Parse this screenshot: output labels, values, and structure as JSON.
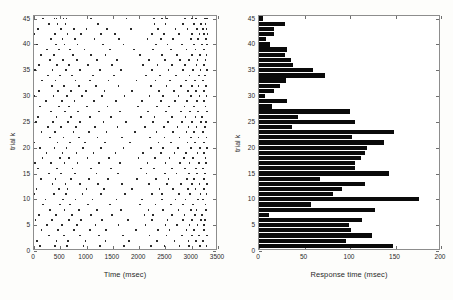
{
  "figure": {
    "panels": [
      {
        "id": "raster",
        "xlabel": "Time (msec)",
        "ylabel": "trial k",
        "xticks": [
          0,
          500,
          1000,
          1500,
          2000,
          2500,
          3000,
          3500
        ],
        "yticks": [
          0,
          5,
          10,
          15,
          20,
          25,
          30,
          35,
          40,
          45
        ]
      },
      {
        "id": "response",
        "xlabel": "Response time (msec)",
        "ylabel": "trial k",
        "xticks": [
          0,
          50,
          100,
          150,
          200
        ],
        "yticks": [
          0,
          5,
          10,
          15,
          20,
          25,
          30,
          35,
          40,
          45
        ]
      }
    ]
  },
  "chart_data": [
    {
      "type": "scatter",
      "title": "",
      "xlabel": "Time (msec)",
      "ylabel": "trial k",
      "xlim": [
        0,
        3500
      ],
      "ylim": [
        0,
        45.5
      ],
      "xticks": [
        0,
        500,
        1000,
        1500,
        2000,
        2500,
        3000,
        3500
      ],
      "yticks": [
        0,
        5,
        10,
        15,
        20,
        25,
        30,
        35,
        40,
        45
      ],
      "grid": false,
      "legend": null,
      "marker": "square",
      "marker_color": "#2b2b2b",
      "description": "Spike raster: each row k is a trial, each dot a spike time.",
      "trials": [
        {
          "k": 45,
          "spikes": [
            170,
            390,
            430,
            560,
            620,
            1090,
            1760,
            2280,
            2430,
            2530,
            2870,
            3010,
            3080,
            3250,
            3290
          ]
        },
        {
          "k": 44,
          "spikes": [
            290,
            450,
            600,
            1220,
            2290,
            2500,
            2840,
            3050,
            3180,
            3260
          ]
        },
        {
          "k": 43,
          "spikes": [
            80,
            520,
            760,
            1000,
            1390,
            1840,
            2360,
            2690,
            2920,
            3100,
            3220,
            3280
          ]
        },
        {
          "k": 42,
          "spikes": [
            10,
            400,
            640,
            900,
            1270,
            1540,
            2250,
            2470,
            2760,
            3000,
            3150,
            3230,
            3300
          ]
        },
        {
          "k": 41,
          "spikes": [
            330,
            540,
            780,
            1150,
            1620,
            2160,
            2410,
            2650,
            2980,
            3120,
            3270
          ]
        },
        {
          "k": 40,
          "spikes": [
            60,
            420,
            580,
            830,
            1310,
            1700,
            2320,
            2540,
            2810,
            3040,
            3190,
            3290
          ]
        },
        {
          "k": 39,
          "spikes": [
            250,
            470,
            680,
            960,
            1450,
            1900,
            2270,
            2600,
            2900,
            3070,
            3240
          ]
        },
        {
          "k": 38,
          "spikes": [
            130,
            380,
            740,
            1080,
            1360,
            2020,
            2440,
            2720,
            3010,
            3160,
            3280
          ]
        },
        {
          "k": 37,
          "spikes": [
            310,
            550,
            820,
            1200,
            1580,
            2190,
            2490,
            2780,
            2950,
            3110,
            3260
          ]
        },
        {
          "k": 36,
          "spikes": [
            90,
            440,
            660,
            1030,
            1480,
            2080,
            2350,
            2630,
            2870,
            3090,
            3230
          ]
        },
        {
          "k": 35,
          "spikes": [
            20,
            350,
            610,
            870,
            1250,
            1660,
            2240,
            2560,
            2840,
            3020,
            3170,
            3290
          ]
        },
        {
          "k": 34,
          "spikes": [
            270,
            500,
            720,
            1120,
            1520,
            2130,
            2400,
            2700,
            2960,
            3140,
            3250
          ]
        },
        {
          "k": 33,
          "spikes": [
            150,
            410,
            790,
            1060,
            1420,
            1950,
            2310,
            2590,
            2890,
            3060,
            3210
          ]
        },
        {
          "k": 32,
          "spikes": [
            340,
            570,
            850,
            1180,
            1610,
            2230,
            2520,
            2800,
            3000,
            3130,
            3270
          ]
        },
        {
          "k": 31,
          "spikes": [
            100,
            460,
            700,
            990,
            1340,
            1870,
            2380,
            2660,
            2930,
            3080,
            3240
          ]
        },
        {
          "k": 30,
          "spikes": [
            10,
            370,
            630,
            910,
            1290,
            1720,
            2200,
            2460,
            2750,
            2990,
            3150,
            3280
          ]
        },
        {
          "k": 29,
          "spikes": [
            230,
            530,
            770,
            1140,
            1560,
            2060,
            2420,
            2680,
            2910,
            3100,
            3230
          ]
        },
        {
          "k": 28,
          "spikes": [
            120,
            480,
            670,
            1010,
            1400,
            1980,
            2340,
            2570,
            2860,
            3040,
            3260
          ]
        },
        {
          "k": 27,
          "spikes": [
            320,
            590,
            840,
            1230,
            1640,
            2170,
            2510,
            2790,
            2970,
            3120,
            3290
          ]
        },
        {
          "k": 26,
          "spikes": [
            70,
            430,
            710,
            1070,
            1460,
            2040,
            2290,
            2620,
            2880,
            3070,
            3200
          ]
        },
        {
          "k": 25,
          "spikes": [
            40,
            360,
            650,
            880,
            1320,
            1750,
            2260,
            2550,
            2820,
            3010,
            3180,
            3270
          ]
        },
        {
          "k": 24,
          "spikes": [
            260,
            510,
            800,
            1160,
            1590,
            2110,
            2470,
            2730,
            2940,
            3090,
            3250
          ]
        },
        {
          "k": 23,
          "spikes": [
            140,
            400,
            750,
            1040,
            1380,
            1920,
            2330,
            2640,
            2900,
            3050,
            3220
          ]
        },
        {
          "k": 22,
          "spikes": [
            300,
            560,
            860,
            1210,
            1670,
            2210,
            2480,
            2770,
            2990,
            3130,
            3280
          ]
        },
        {
          "k": 21,
          "spikes": [
            10,
            450,
            690,
            970,
            1350,
            1830,
            2370,
            2610,
            2920,
            3060,
            3240
          ]
        },
        {
          "k": 20,
          "spikes": [
            110,
            390,
            620,
            930,
            1270,
            1700,
            2220,
            2450,
            2740,
            2980,
            3160,
            3290
          ]
        },
        {
          "k": 19,
          "spikes": [
            240,
            540,
            810,
            1130,
            1550,
            2070,
            2410,
            2670,
            2890,
            3110,
            3230
          ]
        },
        {
          "k": 18,
          "spikes": [
            160,
            490,
            660,
            1020,
            1430,
            1990,
            2300,
            2580,
            2850,
            3030,
            3260
          ]
        },
        {
          "k": 17,
          "spikes": [
            20,
            330,
            580,
            830,
            1240,
            1630,
            2160,
            2500,
            2780,
            2960,
            3140,
            3270
          ]
        },
        {
          "k": 16,
          "spikes": [
            80,
            440,
            730,
            1090,
            1470,
            2030,
            2280,
            2630,
            2870,
            3080,
            3210
          ]
        },
        {
          "k": 15,
          "spikes": [
            280,
            520,
            780,
            1190,
            1600,
            2140,
            2490,
            2710,
            2950,
            3100,
            3250
          ]
        },
        {
          "k": 14,
          "spikes": [
            130,
            410,
            700,
            1050,
            1410,
            1960,
            2320,
            2560,
            2910,
            3040,
            3230
          ]
        },
        {
          "k": 13,
          "spikes": [
            350,
            600,
            880,
            1220,
            1680,
            2190,
            2530,
            2800,
            3000,
            3150,
            3290
          ]
        },
        {
          "k": 12,
          "spikes": [
            50,
            470,
            640,
            1000,
            1330,
            1860,
            2390,
            2650,
            2930,
            3070,
            3240
          ]
        },
        {
          "k": 11,
          "spikes": [
            10,
            380,
            610,
            920,
            1280,
            1730,
            2240,
            2440,
            2760,
            2970,
            3170,
            3280
          ]
        },
        {
          "k": 10,
          "spikes": [
            220,
            550,
            790,
            1110,
            1570,
            2050,
            2430,
            2690,
            2880,
            3120,
            3220
          ]
        },
        {
          "k": 9,
          "spikes": [
            170,
            500,
            680,
            1030,
            1440,
            2010,
            2310,
            2600,
            2840,
            3020,
            3260
          ]
        },
        {
          "k": 8,
          "spikes": [
            310,
            580,
            850,
            1200,
            1650,
            2180,
            2460,
            2750,
            2990,
            3090,
            3270
          ]
        },
        {
          "k": 7,
          "spikes": [
            90,
            420,
            720,
            1080,
            1490,
            2100,
            2270,
            2620,
            2860,
            3060,
            3200
          ]
        },
        {
          "k": 6,
          "spikes": [
            30,
            340,
            670,
            900,
            1300,
            1790,
            2250,
            2540,
            2830,
            3000,
            3180,
            3250
          ]
        },
        {
          "k": 5,
          "spikes": [
            250,
            530,
            820,
            1170,
            1610,
            2120,
            2500,
            2720,
            2960,
            3110,
            3240
          ]
        },
        {
          "k": 4,
          "spikes": [
            140,
            460,
            760,
            1060,
            1370,
            1940,
            2360,
            2580,
            2900,
            3050,
            3230
          ]
        },
        {
          "k": 3,
          "spikes": [
            290,
            570,
            870,
            1240,
            1690,
            2200,
            2520,
            2810,
            3010,
            3140,
            3290
          ]
        },
        {
          "k": 2,
          "spikes": [
            60,
            430,
            650,
            980,
            1360,
            1810,
            2340,
            2670,
            2940,
            3080,
            3210
          ]
        },
        {
          "k": 1,
          "spikes": [
            120,
            400,
            630,
            940,
            1260,
            1710,
            2230,
            2480,
            2770,
            2950,
            3160,
            3280
          ]
        }
      ]
    },
    {
      "type": "bar",
      "orientation": "horizontal",
      "title": "",
      "xlabel": "Response time (msec)",
      "ylabel": "trial k",
      "xlim": [
        0,
        200
      ],
      "ylim": [
        0,
        45.5
      ],
      "xticks": [
        0,
        50,
        100,
        150,
        200
      ],
      "yticks": [
        0,
        5,
        10,
        15,
        20,
        25,
        30,
        35,
        40,
        45
      ],
      "grid": false,
      "legend": null,
      "bar_color": "#0a0a0a",
      "categories": [
        1,
        2,
        3,
        4,
        5,
        6,
        7,
        8,
        9,
        10,
        11,
        12,
        13,
        14,
        15,
        16,
        17,
        18,
        19,
        20,
        21,
        22,
        23,
        24,
        25,
        26,
        27,
        28,
        29,
        30,
        31,
        32,
        33,
        34,
        35,
        36,
        37,
        38,
        39,
        40,
        41,
        42,
        43,
        44,
        45
      ],
      "values": [
        147,
        96,
        124,
        101,
        99,
        113,
        11,
        127,
        57,
        176,
        81,
        91,
        116,
        67,
        143,
        105,
        106,
        112,
        117,
        119,
        137,
        102,
        148,
        36,
        106,
        43,
        100,
        14,
        31,
        7,
        17,
        23,
        30,
        73,
        59,
        37,
        35,
        29,
        31,
        12,
        8,
        16,
        16,
        29,
        4
      ]
    }
  ]
}
